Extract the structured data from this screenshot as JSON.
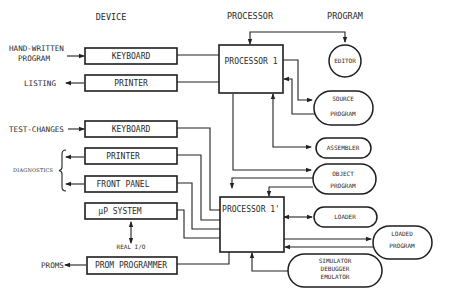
{
  "headers": {
    "device": "DEVICE",
    "processor": "PROCESSOR",
    "program": "PROGRAM"
  },
  "inputs": {
    "hand_written_1": "HAND-WRITTEN",
    "hand_written_2": "PROGRAM",
    "listing": "LISTING",
    "test_changes": "TEST-CHANGES",
    "diagnostics": "DIAGNOSTICS",
    "real_io": "REAL I/O",
    "proms": "PROMS"
  },
  "devices": [
    {
      "label": "KEYBOARD"
    },
    {
      "label": "PRINTER"
    },
    {
      "label": "KEYBOARD"
    },
    {
      "label": "PRINTER"
    },
    {
      "label": "FRONT PANEL"
    },
    {
      "label": "μP SYSTEM"
    },
    {
      "label": "PROM PROGRAMMER"
    }
  ],
  "processors": [
    {
      "label": "PROCESSOR 1"
    },
    {
      "label": "PROCESSOR 1'"
    }
  ],
  "programs": {
    "editor": "EDITOR",
    "source_1": "SOURCE",
    "source_2": "PROGRAM",
    "assembler": "ASSEMBLER",
    "object_1": "OBJECT",
    "object_2": "PROGRAM",
    "loader": "LOADER",
    "loaded_1": "LOADED",
    "loaded_2": "PROGRAM",
    "sim_1": "SIMULATOR",
    "sim_2": "DEBUGGER",
    "sim_3": "EMULATOR"
  }
}
